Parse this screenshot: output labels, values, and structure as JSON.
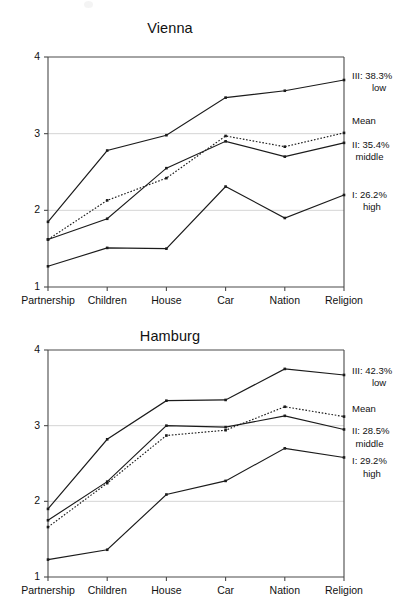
{
  "figure": {
    "background_color": "#ffffff",
    "axis_color": "#4a4a4a",
    "grid_color": "#c9c9c9",
    "line_color": "#1b1b1b"
  },
  "charts": [
    {
      "id": "vienna",
      "title": "Vienna",
      "ytick_labels": [
        "4",
        "3",
        "2",
        "1"
      ],
      "xtick_labels": [
        "Partnership",
        "Children",
        "House",
        "Car",
        "Nation",
        "Religion"
      ],
      "legend": [
        {
          "line1": "III: 38.3%",
          "line2": "low"
        },
        {
          "line1": "Mean",
          "line2": ""
        },
        {
          "line1": "II: 35.4%",
          "line2": "middle"
        },
        {
          "line1": "I: 26.2%",
          "line2": "high"
        }
      ]
    },
    {
      "id": "hamburg",
      "title": "Hamburg",
      "ytick_labels": [
        "4",
        "3",
        "2",
        "1"
      ],
      "xtick_labels": [
        "Partnership",
        "Children",
        "House",
        "Car",
        "Nation",
        "Religion"
      ],
      "legend": [
        {
          "line1": "III: 42.3%",
          "line2": "low"
        },
        {
          "line1": "Mean",
          "line2": ""
        },
        {
          "line1": "II: 28.5%",
          "line2": "middle"
        },
        {
          "line1": "I: 29.2%",
          "line2": "high"
        }
      ]
    }
  ],
  "chart_data": [
    {
      "type": "line",
      "title": "Vienna",
      "xlabel": "",
      "ylabel": "",
      "categories": [
        "Partnership",
        "Children",
        "House",
        "Car",
        "Nation",
        "Religion"
      ],
      "ylim": [
        1,
        4
      ],
      "yticks": [
        1,
        2,
        3,
        4
      ],
      "grid": "horizontal-at-2-and-3",
      "legend_position": "right-outside",
      "series": [
        {
          "name": "III: 38.3% low",
          "style": "solid",
          "label_line1": "III: 38.3%",
          "label_line2": "low",
          "values": [
            1.85,
            2.78,
            2.98,
            3.47,
            3.56,
            3.7
          ]
        },
        {
          "name": "Mean",
          "style": "dotted",
          "label_line1": "Mean",
          "label_line2": "",
          "values": [
            1.62,
            2.13,
            2.42,
            2.97,
            2.83,
            3.01
          ]
        },
        {
          "name": "II: 35.4% middle",
          "style": "solid",
          "label_line1": "II: 35.4%",
          "label_line2": "middle",
          "values": [
            1.62,
            1.89,
            2.55,
            2.9,
            2.7,
            2.88
          ]
        },
        {
          "name": "I: 26.2% high",
          "style": "solid",
          "label_line1": "I: 26.2%",
          "label_line2": "high",
          "values": [
            1.27,
            1.51,
            1.5,
            2.31,
            1.9,
            2.2
          ]
        }
      ]
    },
    {
      "type": "line",
      "title": "Hamburg",
      "xlabel": "",
      "ylabel": "",
      "categories": [
        "Partnership",
        "Children",
        "House",
        "Car",
        "Nation",
        "Religion"
      ],
      "ylim": [
        1,
        4
      ],
      "yticks": [
        1,
        2,
        3,
        4
      ],
      "grid": "horizontal-at-2-and-3",
      "legend_position": "right-outside",
      "series": [
        {
          "name": "III: 42.3% low",
          "style": "solid",
          "label_line1": "III: 42.3%",
          "label_line2": "low",
          "values": [
            1.9,
            2.82,
            3.33,
            3.34,
            3.75,
            3.67
          ]
        },
        {
          "name": "Mean",
          "style": "dotted",
          "label_line1": "Mean",
          "label_line2": "",
          "values": [
            1.66,
            2.24,
            2.87,
            2.94,
            3.25,
            3.12
          ]
        },
        {
          "name": "II: 28.5% middle",
          "style": "solid",
          "label_line1": "II: 28.5%",
          "label_line2": "middle",
          "values": [
            1.75,
            2.26,
            3.0,
            2.98,
            3.13,
            2.95
          ]
        },
        {
          "name": "I: 29.2% high",
          "style": "solid",
          "label_line1": "I: 29.2%",
          "label_line2": "high",
          "values": [
            1.23,
            1.36,
            2.09,
            2.27,
            2.7,
            2.58
          ]
        }
      ]
    }
  ]
}
